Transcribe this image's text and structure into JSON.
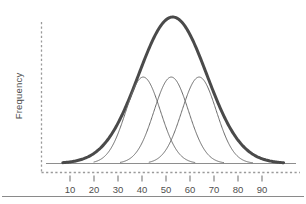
{
  "figure": {
    "background_color": "#ffffff",
    "bottom_rule_color": "#8a8a8a"
  },
  "axes": {
    "y_title": "Frequency",
    "axis_line_style": "dashed",
    "axis_line_color": "#9a9a9a",
    "baseline_color": "#8e8e8e",
    "tick_color": "#7a7a7a",
    "tick_label_color": "#4f4f4f"
  },
  "chart_data": {
    "type": "line",
    "title": "",
    "xlabel": "",
    "ylabel": "Frequency",
    "xlim": [
      4,
      100
    ],
    "ylim": [
      0,
      1.06
    ],
    "grid": false,
    "legend_position": "none",
    "x_ticks": [
      10,
      20,
      30,
      40,
      50,
      60,
      70,
      80,
      90
    ],
    "x_tick_labels": [
      "10",
      "20",
      "30",
      "40",
      "50",
      "60",
      "70",
      "80",
      "90"
    ],
    "y_ticks": [],
    "y_tick_labels": [],
    "series": [
      {
        "name": "overall-distribution",
        "style": "bold",
        "color": "#4a4a4a",
        "line_width": 3.0,
        "mean": 52.8,
        "sigma": 14.2,
        "peak_value": 1.0,
        "x_start": 7,
        "x_end": 99
      },
      {
        "name": "component-distribution-1",
        "style": "thin",
        "color": "#6b6b6b",
        "line_width": 1.0,
        "mean": 40.5,
        "sigma": 7.2,
        "peak_value": 0.59,
        "x_start": 20,
        "x_end": 62
      },
      {
        "name": "component-distribution-2",
        "style": "thin",
        "color": "#6b6b6b",
        "line_width": 1.0,
        "mean": 52.2,
        "sigma": 7.2,
        "peak_value": 0.59,
        "x_start": 31,
        "x_end": 74
      },
      {
        "name": "component-distribution-3",
        "style": "thin",
        "color": "#6b6b6b",
        "line_width": 1.0,
        "mean": 63.8,
        "sigma": 7.2,
        "peak_value": 0.59,
        "x_start": 43,
        "x_end": 86
      }
    ]
  }
}
